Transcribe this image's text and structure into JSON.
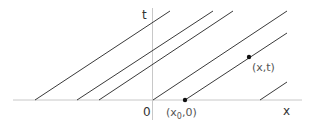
{
  "diagram": {
    "axes": {
      "x_label": "x",
      "t_label": "t",
      "origin_label": "0"
    },
    "points": [
      {
        "id": "x0",
        "label": "(x0,0)",
        "label_main": "(x",
        "label_sub": "0",
        "label_tail": ",0)"
      },
      {
        "id": "xt",
        "label": "(x,t)"
      }
    ],
    "lines_count": 6,
    "colors": {
      "axis": "#c8c8c8",
      "line": "#3a3a3a",
      "point": "#111111",
      "text": "#333333"
    }
  }
}
